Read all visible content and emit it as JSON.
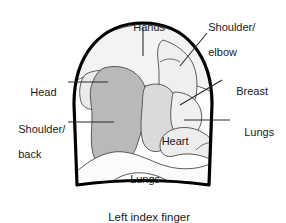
{
  "figure": {
    "caption": "Left index finger",
    "background_color": "#ffffff",
    "outline_color": "#000000",
    "region_line_color": "#3a3a3a"
  },
  "labels": {
    "hands": "Hands",
    "shoulder_elbow_line1": "Shoulder/",
    "shoulder_elbow_line2": "elbow",
    "head": "Head",
    "breast": "Breast",
    "shoulder_back_line1": "Shoulder/",
    "shoulder_back_line2": "back",
    "lungs_right": "Lungs",
    "heart": "Heart",
    "lungs_inner": "Lungs"
  },
  "regions": [
    {
      "name": "hands",
      "label": "Hands",
      "fill": "#f2f2f2",
      "label_placement": "outside-top"
    },
    {
      "name": "shoulder-elbow",
      "label": "Shoulder/elbow",
      "fill": "#f2f2f2",
      "label_placement": "outside-top-right"
    },
    {
      "name": "head",
      "label": "Head",
      "fill": "#eeeeee",
      "label_placement": "outside-left"
    },
    {
      "name": "shoulder-back",
      "label": "Shoulder/back",
      "fill": "#b8b8b8",
      "label_placement": "outside-left"
    },
    {
      "name": "heart",
      "label": "Heart",
      "fill": "#d9d9d9",
      "label_placement": "inside"
    },
    {
      "name": "breast",
      "label": "Breast",
      "fill": "#f0f0f0",
      "label_placement": "outside-right"
    },
    {
      "name": "lungs-right",
      "label": "Lungs",
      "fill": "#ececec",
      "label_placement": "outside-right"
    },
    {
      "name": "lungs-inner",
      "label": "Lungs",
      "fill": "#fbfbfb",
      "label_placement": "inside"
    }
  ],
  "colors": {
    "dark_gray_fill": "#b8b8b8",
    "mid_gray_fill": "#d9d9d9",
    "light_gray_fill": "#f1f1f1",
    "near_white_fill": "#fbfbfb",
    "outline": "#000000",
    "leader_line": "#2b2b2b",
    "text": "#1a1a1a"
  }
}
